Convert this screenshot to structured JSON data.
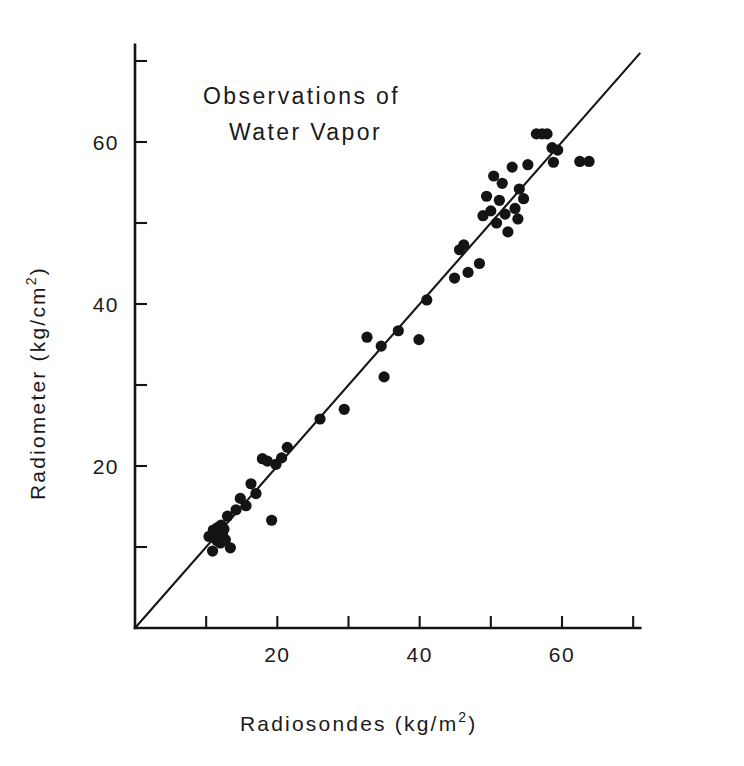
{
  "chart_data": {
    "type": "scatter",
    "title": "Observations of Water Vapor",
    "title_line1": "Observations of",
    "title_line2": "Water Vapor",
    "xlabel": "Radiosondes (kg/m2)",
    "xlabel_text": "Radiosondes  (kg/m",
    "xlabel_sup": "2",
    "xlabel_tail": ")",
    "ylabel": "Radiometer (kg/cm2)",
    "ylabel_text": "Radiometer  (kg/cm",
    "ylabel_sup": "2",
    "ylabel_tail": ")",
    "xlim": [
      0,
      71
    ],
    "ylim": [
      0,
      72
    ],
    "xticks": [
      10,
      20,
      30,
      40,
      50,
      60,
      70
    ],
    "xtick_labels": [
      "",
      "20",
      "",
      "40",
      "",
      "60",
      ""
    ],
    "yticks": [
      10,
      20,
      30,
      40,
      50,
      60,
      70
    ],
    "ytick_labels": [
      "",
      "20",
      "",
      "40",
      "",
      "60",
      ""
    ],
    "grid": false,
    "legend": "none",
    "marker_color": "#141414",
    "axis_color": "#151515",
    "background_color": "#ffffff",
    "fit_line": {
      "label": "one-to-one reference line",
      "x0": 0.0,
      "y0": 0.0,
      "x1": 71.0,
      "y1": 71.0
    },
    "series": [
      {
        "name": "Radiometer vs Radiosondes",
        "points": [
          [
            10.4,
            11.3
          ],
          [
            10.9,
            9.5
          ],
          [
            11.0,
            12.1
          ],
          [
            11.3,
            11.6
          ],
          [
            11.5,
            10.8
          ],
          [
            11.6,
            12.4
          ],
          [
            11.8,
            11.0
          ],
          [
            11.9,
            11.9
          ],
          [
            12.0,
            10.5
          ],
          [
            12.1,
            12.7
          ],
          [
            12.3,
            11.4
          ],
          [
            12.5,
            12.2
          ],
          [
            12.7,
            10.9
          ],
          [
            13.0,
            13.8
          ],
          [
            13.4,
            9.9
          ],
          [
            14.2,
            14.6
          ],
          [
            14.8,
            16.0
          ],
          [
            15.6,
            15.1
          ],
          [
            16.3,
            17.8
          ],
          [
            17.0,
            16.6
          ],
          [
            17.9,
            20.9
          ],
          [
            18.6,
            20.6
          ],
          [
            19.2,
            13.3
          ],
          [
            19.8,
            20.2
          ],
          [
            20.6,
            21.0
          ],
          [
            21.4,
            22.3
          ],
          [
            26.0,
            25.8
          ],
          [
            29.4,
            27.0
          ],
          [
            32.6,
            35.9
          ],
          [
            34.6,
            34.8
          ],
          [
            35.0,
            31.0
          ],
          [
            37.0,
            36.7
          ],
          [
            39.9,
            35.6
          ],
          [
            41.0,
            40.5
          ],
          [
            44.9,
            43.2
          ],
          [
            45.6,
            46.7
          ],
          [
            46.2,
            47.3
          ],
          [
            46.8,
            43.9
          ],
          [
            48.4,
            45.0
          ],
          [
            48.9,
            50.9
          ],
          [
            49.4,
            53.3
          ],
          [
            50.0,
            51.5
          ],
          [
            50.4,
            55.8
          ],
          [
            50.8,
            50.0
          ],
          [
            51.2,
            52.8
          ],
          [
            51.6,
            54.9
          ],
          [
            52.0,
            51.1
          ],
          [
            52.4,
            48.9
          ],
          [
            53.0,
            56.9
          ],
          [
            53.4,
            51.8
          ],
          [
            53.8,
            50.5
          ],
          [
            54.0,
            54.2
          ],
          [
            54.6,
            53.0
          ],
          [
            55.2,
            57.2
          ],
          [
            56.4,
            61.0
          ],
          [
            57.2,
            61.0
          ],
          [
            57.9,
            61.0
          ],
          [
            58.6,
            59.3
          ],
          [
            58.8,
            57.5
          ],
          [
            59.4,
            59.0
          ],
          [
            62.5,
            57.6
          ],
          [
            63.8,
            57.6
          ]
        ]
      }
    ]
  }
}
